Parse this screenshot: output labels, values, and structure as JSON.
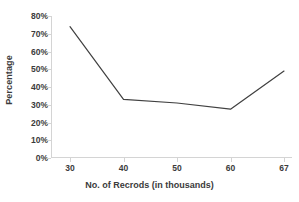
{
  "chart_data": {
    "type": "line",
    "title": "",
    "xlabel": "No. of Recrods  (in thousands)",
    "ylabel": "Percentage",
    "categories": [
      "30",
      "40",
      "50",
      "60",
      "67"
    ],
    "x": [
      30,
      40,
      50,
      60,
      67
    ],
    "values": [
      0.74,
      0.33,
      0.31,
      0.275,
      0.49
    ],
    "value_labels": [
      "74%",
      "33%",
      "31%",
      "27.5%",
      "49%"
    ],
    "ylim": [
      0,
      0.8
    ],
    "ytick_values": [
      0.8,
      0.7,
      0.6,
      0.5,
      0.4,
      0.3,
      0.2,
      0.1,
      0
    ],
    "ytick_labels": [
      "80%",
      "70%",
      "60%",
      "50%",
      "40%",
      "30%",
      "20%",
      "10%",
      "0%"
    ],
    "grid": false,
    "legend": false,
    "markers": false,
    "series": [
      {
        "name": "Percentage",
        "values": [
          0.74,
          0.33,
          0.31,
          0.275,
          0.49
        ]
      }
    ],
    "colors": {
      "line": "#404040",
      "axis": "#d4d4d4",
      "text": "#3b3b3b",
      "background": "#ffffff"
    },
    "line_width": 1.2
  }
}
